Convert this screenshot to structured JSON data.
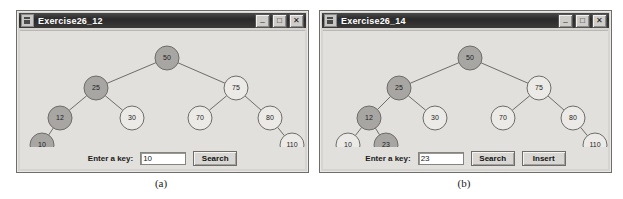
{
  "figure": {
    "captions": [
      {
        "label": "(a)"
      },
      {
        "label": "(b)"
      }
    ]
  },
  "colors": {
    "node_highlight_fill": "#a8a6a2",
    "node_plain_fill": "#eceae6",
    "node_stroke": "#6e6c68",
    "edge_stroke": "#6e6c68",
    "window_bg": "#e2e0dc",
    "titlebar_bg": "#2a2a2a",
    "titlebar_text": "#ffffff"
  },
  "windows": [
    {
      "id": "window-a",
      "title": "Exercise26_12",
      "title_icon": "java-app-icon",
      "buttons": {
        "minimize": "_",
        "maximize": "□",
        "close": "✕"
      },
      "controls": {
        "key_label": "Enter a key:",
        "key_value": "10",
        "key_placeholder": "",
        "search_label": "Search"
      },
      "tree": {
        "nodes": [
          {
            "value": "50",
            "cx": 147,
            "cy": 27,
            "r": 12,
            "highlight": true
          },
          {
            "value": "25",
            "cx": 76,
            "cy": 57,
            "r": 12,
            "highlight": true
          },
          {
            "value": "12",
            "cx": 40,
            "cy": 87,
            "r": 12,
            "highlight": true
          },
          {
            "value": "10",
            "cx": 22,
            "cy": 114,
            "r": 12,
            "highlight": true
          },
          {
            "value": "30",
            "cx": 112,
            "cy": 87,
            "r": 12,
            "highlight": false
          },
          {
            "value": "75",
            "cx": 216,
            "cy": 57,
            "r": 12,
            "highlight": false
          },
          {
            "value": "70",
            "cx": 180,
            "cy": 87,
            "r": 12,
            "highlight": false
          },
          {
            "value": "80",
            "cx": 250,
            "cy": 87,
            "r": 12,
            "highlight": false
          },
          {
            "value": "110",
            "cx": 272,
            "cy": 114,
            "r": 12,
            "highlight": false
          }
        ],
        "edges": [
          {
            "from": "50",
            "to": "25"
          },
          {
            "from": "50",
            "to": "75"
          },
          {
            "from": "25",
            "to": "12"
          },
          {
            "from": "25",
            "to": "30"
          },
          {
            "from": "12",
            "to": "10"
          },
          {
            "from": "75",
            "to": "70"
          },
          {
            "from": "75",
            "to": "80"
          },
          {
            "from": "80",
            "to": "110"
          }
        ]
      }
    },
    {
      "id": "window-b",
      "title": "Exercise26_14",
      "title_icon": "java-app-icon",
      "buttons": {
        "minimize": "_",
        "maximize": "□",
        "close": "✕"
      },
      "controls": {
        "key_label": "Enter a key:",
        "key_value": "23",
        "key_placeholder": "",
        "search_label": "Search",
        "insert_label": "Insert"
      },
      "tree": {
        "nodes": [
          {
            "value": "50",
            "cx": 147,
            "cy": 27,
            "r": 12,
            "highlight": true
          },
          {
            "value": "25",
            "cx": 76,
            "cy": 57,
            "r": 12,
            "highlight": true
          },
          {
            "value": "12",
            "cx": 46,
            "cy": 87,
            "r": 12,
            "highlight": true
          },
          {
            "value": "10",
            "cx": 25,
            "cy": 114,
            "r": 12,
            "highlight": false
          },
          {
            "value": "23",
            "cx": 63,
            "cy": 114,
            "r": 12,
            "highlight": true
          },
          {
            "value": "30",
            "cx": 112,
            "cy": 87,
            "r": 12,
            "highlight": false
          },
          {
            "value": "75",
            "cx": 216,
            "cy": 57,
            "r": 12,
            "highlight": false
          },
          {
            "value": "70",
            "cx": 180,
            "cy": 87,
            "r": 12,
            "highlight": false
          },
          {
            "value": "80",
            "cx": 250,
            "cy": 87,
            "r": 12,
            "highlight": false
          },
          {
            "value": "110",
            "cx": 272,
            "cy": 114,
            "r": 12,
            "highlight": false
          }
        ],
        "edges": [
          {
            "from": "50",
            "to": "25"
          },
          {
            "from": "50",
            "to": "75"
          },
          {
            "from": "25",
            "to": "12"
          },
          {
            "from": "25",
            "to": "30"
          },
          {
            "from": "12",
            "to": "10"
          },
          {
            "from": "12",
            "to": "23"
          },
          {
            "from": "75",
            "to": "70"
          },
          {
            "from": "75",
            "to": "80"
          },
          {
            "from": "80",
            "to": "110"
          }
        ]
      }
    }
  ]
}
